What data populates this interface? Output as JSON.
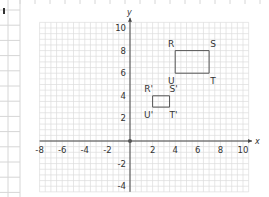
{
  "chart_data": {
    "type": "scatter",
    "title": "",
    "xlabel": "x",
    "ylabel": "y",
    "xlim": [
      -8,
      10.5
    ],
    "ylim": [
      -4.5,
      10.5
    ],
    "grid": true,
    "x_ticks": [
      -8,
      -6,
      -4,
      -2,
      2,
      4,
      6,
      8,
      10
    ],
    "y_ticks": [
      -4,
      -2,
      2,
      4,
      6,
      8,
      10
    ],
    "x_tick_labels": [
      "-8",
      "-6",
      "-4",
      "-2",
      "2",
      "4",
      "6",
      "8",
      "10"
    ],
    "y_tick_labels": [
      "-4",
      "-2",
      "2",
      "4",
      "6",
      "8",
      "10"
    ],
    "shapes": [
      {
        "name": "RSTU",
        "vertices": [
          {
            "label": "R",
            "x": 4,
            "y": 8,
            "label_pos": "top-left"
          },
          {
            "label": "S",
            "x": 7,
            "y": 8,
            "label_pos": "top-right"
          },
          {
            "label": "T",
            "x": 7,
            "y": 6,
            "label_pos": "bottom-right"
          },
          {
            "label": "U",
            "x": 4,
            "y": 6,
            "label_pos": "bottom-left"
          }
        ]
      },
      {
        "name": "R'S'T'U'",
        "vertices": [
          {
            "label": "R'",
            "x": 2,
            "y": 4,
            "label_pos": "top-left"
          },
          {
            "label": "S'",
            "x": 3.5,
            "y": 4,
            "label_pos": "top-right"
          },
          {
            "label": "T'",
            "x": 3.5,
            "y": 3,
            "label_pos": "bottom-right"
          },
          {
            "label": "U'",
            "x": 2,
            "y": 3,
            "label_pos": "bottom-left"
          }
        ]
      }
    ],
    "origin_marker": true
  },
  "colors": {
    "grid": "#dcdcdc",
    "axis": "#444444",
    "shape": "#555555",
    "text": "#333333"
  }
}
